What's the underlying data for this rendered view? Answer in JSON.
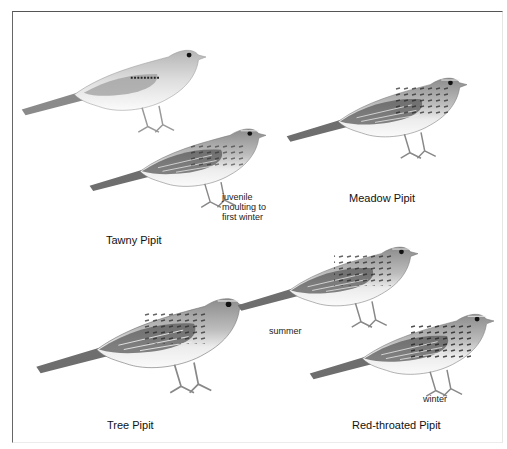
{
  "plate": {
    "species": [
      {
        "id": "tawny",
        "name": "Tawny Pipit",
        "notes": [
          "juvenile",
          "moulting to",
          "first winter"
        ]
      },
      {
        "id": "meadow",
        "name": "Meadow Pipit",
        "notes": []
      },
      {
        "id": "tree",
        "name": "Tree Pipit",
        "notes": []
      },
      {
        "id": "red-throated",
        "name": "Red-throated Pipit",
        "notes": [
          "summer",
          "winter"
        ]
      }
    ]
  },
  "labels": {
    "tawny_name": "Tawny Pipit",
    "tawny_note_1": "juvenile",
    "tawny_note_2": "moulting to",
    "tawny_note_3": "first winter",
    "meadow_name": "Meadow Pipit",
    "tree_name": "Tree Pipit",
    "redthroat_name": "Red-throated Pipit",
    "redthroat_summer": "summer",
    "redthroat_winter": "winter"
  },
  "colors": {
    "frame": "#555555",
    "plumage_light": "#d9d9d9",
    "plumage_mid": "#9a9a9a",
    "plumage_dark": "#2e2e2e",
    "text": "#111111"
  }
}
